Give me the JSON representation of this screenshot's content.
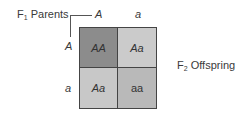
{
  "labels": {
    "parents_prefix": "F",
    "parents_sub": "1",
    "parents_text": " Parents",
    "offspring_prefix": "F",
    "offspring_sub": "2",
    "offspring_text": " Offspring"
  },
  "alleles": {
    "top": [
      "A",
      "a"
    ],
    "left": [
      "A",
      "a"
    ]
  },
  "cells": [
    {
      "genotype": "AA",
      "color": "#8c8c8c",
      "italic": true
    },
    {
      "genotype": "Aa",
      "color": "#cbcbcb",
      "italic": true
    },
    {
      "genotype": "Aa",
      "color": "#c8c8c8",
      "italic": true
    },
    {
      "genotype": "aa",
      "color": "#b9b9b9",
      "italic": false
    }
  ]
}
